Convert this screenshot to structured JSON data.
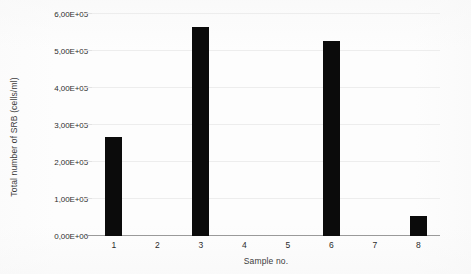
{
  "chart_data": {
    "type": "bar",
    "title": "",
    "xlabel": "Sample no.",
    "ylabel": "Total number of SRB (cells/ml)",
    "categories": [
      "1",
      "2",
      "3",
      "4",
      "5",
      "6",
      "7",
      "8"
    ],
    "values": [
      267000,
      0,
      564000,
      0,
      0,
      527000,
      0,
      55000
    ],
    "series": [
      {
        "name": "Total number of SRB",
        "values": [
          267000,
          0,
          564000,
          0,
          0,
          527000,
          0,
          55000
        ]
      }
    ],
    "ylim": [
      0,
      600000
    ],
    "ytick_values": [
      0,
      100000,
      200000,
      300000,
      400000,
      500000,
      600000
    ],
    "ytick_labels": [
      "0,00E+00",
      "1,00E+05",
      "2,00E+05",
      "3,00E+05",
      "4,00E+05",
      "5,00E+05",
      "6,00E+05"
    ],
    "grid": true,
    "legend": "none",
    "bar_color": "#0b0b0b",
    "gridline_color": "#ededed",
    "axis_color": "#9a9a9a"
  }
}
